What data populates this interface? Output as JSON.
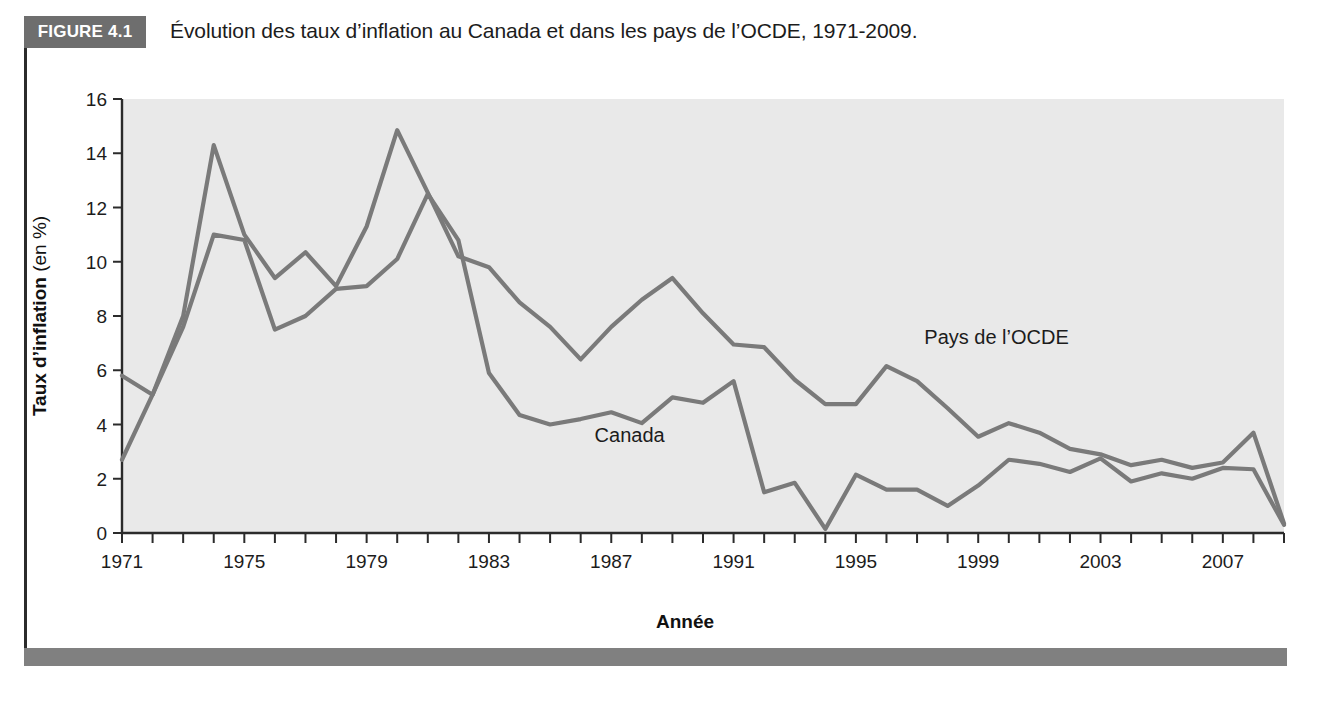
{
  "figure": {
    "badge": "FIGURE 4.1",
    "caption": "Évolution des taux d’inflation au Canada et dans les pays de l’OCDE, 1971-2009."
  },
  "colors": {
    "badge_bg": "#6e6e6e",
    "plot_bg": "#e9e9e9",
    "line": "#7a7a7a",
    "axis": "#2b2b2b",
    "bottom_bar": "#808080"
  },
  "chart_data": {
    "type": "line",
    "title": "Évolution des taux d’inflation au Canada et dans les pays de l’OCDE, 1971-2009.",
    "xlabel": "Année",
    "ylabel_bold": "Taux d’inflation",
    "ylabel_regular": " (en %)",
    "ylabel": "Taux d’inflation (en %)",
    "grid": false,
    "legend": "inline-annotations",
    "xlim": [
      1971,
      2009
    ],
    "ylim": [
      0,
      16
    ],
    "yticks": [
      0,
      2,
      4,
      6,
      8,
      10,
      12,
      14,
      16
    ],
    "ytick_labels": [
      "0",
      "2",
      "4",
      "6",
      "8",
      "10",
      "12",
      "14",
      "16"
    ],
    "xtick_step": 1,
    "xtick_labels_step": 4,
    "xtick_labels": [
      "1971",
      "1975",
      "1979",
      "1983",
      "1987",
      "1991",
      "1995",
      "1999",
      "2003",
      "2007"
    ],
    "xtick_label_years": [
      1971,
      1975,
      1979,
      1983,
      1987,
      1991,
      1995,
      1999,
      2003,
      2007
    ],
    "x": [
      1971,
      1972,
      1973,
      1974,
      1975,
      1976,
      1977,
      1978,
      1979,
      1980,
      1981,
      1982,
      1983,
      1984,
      1985,
      1986,
      1987,
      1988,
      1989,
      1990,
      1991,
      1992,
      1993,
      1994,
      1995,
      1996,
      1997,
      1998,
      1999,
      2000,
      2001,
      2002,
      2003,
      2004,
      2005,
      2006,
      2007,
      2008,
      2009
    ],
    "series": [
      {
        "name": "Pays de l’OCDE",
        "label": "Pays de l’OCDE",
        "label_x": 1999.6,
        "label_y": 6.95,
        "values": [
          5.8,
          5.1,
          8.0,
          14.3,
          11.0,
          9.4,
          10.35,
          9.1,
          11.3,
          14.85,
          12.55,
          10.2,
          9.8,
          8.5,
          7.6,
          6.4,
          7.6,
          8.6,
          9.4,
          8.1,
          6.95,
          6.85,
          5.65,
          4.75,
          4.75,
          6.15,
          5.6,
          4.6,
          3.55,
          4.05,
          3.7,
          3.1,
          2.9,
          2.5,
          2.7,
          2.4,
          2.6,
          3.7,
          0.35
        ]
      },
      {
        "name": "Canada",
        "label": "Canada",
        "label_x": 1987.6,
        "label_y": 3.35,
        "values": [
          2.7,
          5.1,
          7.6,
          11.0,
          10.8,
          7.5,
          8.0,
          9.0,
          9.1,
          10.1,
          12.5,
          10.8,
          5.9,
          4.35,
          4.0,
          4.2,
          4.45,
          4.05,
          5.0,
          4.8,
          5.6,
          1.5,
          1.85,
          0.15,
          2.15,
          1.6,
          1.6,
          1.0,
          1.75,
          2.7,
          2.55,
          2.25,
          2.75,
          1.9,
          2.2,
          2.0,
          2.4,
          2.35,
          0.3
        ]
      }
    ]
  }
}
